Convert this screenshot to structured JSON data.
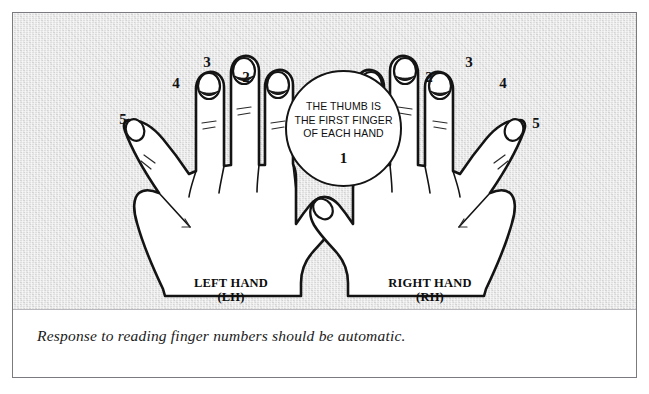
{
  "figure": {
    "background_color": "#e4e4e4",
    "frame_color": "#7a7a80",
    "ink_color": "#141414"
  },
  "callout": {
    "text": "THE THUMB IS\nTHE FIRST FINGER\nOF EACH HAND",
    "number": "1",
    "shape": "circle"
  },
  "left_hand": {
    "caption": "LEFT HAND",
    "abbreviation": "(LH)",
    "finger_numbers": [
      {
        "label": "5",
        "finger": "pinky",
        "x": 110,
        "y": 99
      },
      {
        "label": "4",
        "finger": "ring",
        "x": 163,
        "y": 63
      },
      {
        "label": "3",
        "finger": "middle",
        "x": 194,
        "y": 42
      },
      {
        "label": "2",
        "finger": "index",
        "x": 233,
        "y": 57
      },
      {
        "label": "1",
        "finger": "thumb",
        "x": 327,
        "y": 145
      }
    ]
  },
  "right_hand": {
    "caption": "RIGHT HAND",
    "abbreviation": "(RH)",
    "finger_numbers": [
      {
        "label": "2",
        "finger": "index",
        "x": 416,
        "y": 57
      },
      {
        "label": "3",
        "finger": "middle",
        "x": 456,
        "y": 42
      },
      {
        "label": "4",
        "finger": "ring",
        "x": 490,
        "y": 63
      },
      {
        "label": "5",
        "finger": "pinky",
        "x": 523,
        "y": 103
      }
    ]
  },
  "footnote": {
    "text": "Response to reading finger numbers should be automatic."
  }
}
